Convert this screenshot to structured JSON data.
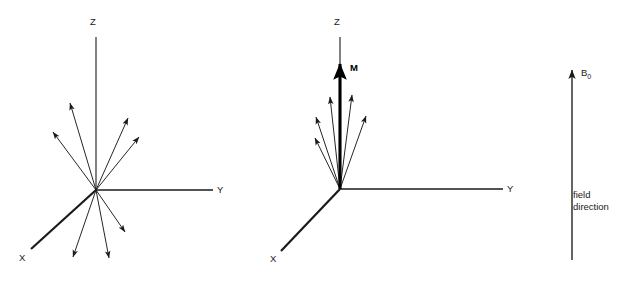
{
  "figure": {
    "background_color": "#ffffff",
    "line_color": "#1a1a1a",
    "bold_color": "#000000",
    "width": 638,
    "height": 283
  },
  "panels": [
    {
      "id": "random-spins",
      "origin": {
        "x": 96,
        "y": 190
      },
      "axes": [
        {
          "name": "z-axis",
          "label": "Z",
          "x1": 96,
          "y1": 37,
          "x2": 96,
          "y2": 190,
          "label_x": 90,
          "label_y": 25,
          "bold": false
        },
        {
          "name": "y-axis",
          "label": "Y",
          "x1": 96,
          "y1": 190,
          "x2": 213,
          "y2": 190,
          "label_x": 217,
          "label_y": 193,
          "bold": false
        },
        {
          "name": "x-axis",
          "label": "X",
          "x1": 96,
          "y1": 190,
          "x2": 31,
          "y2": 249,
          "label_x": 19,
          "label_y": 261,
          "bold": true
        }
      ],
      "spins": [
        {
          "name": "spin-1",
          "x2": 70,
          "y2": 103
        },
        {
          "name": "spin-2",
          "x2": 53,
          "y2": 132
        },
        {
          "name": "spin-3",
          "x2": 128,
          "y2": 118
        },
        {
          "name": "spin-4",
          "x2": 139,
          "y2": 137
        },
        {
          "name": "spin-5",
          "x2": 125,
          "y2": 232
        },
        {
          "name": "spin-6",
          "x2": 109,
          "y2": 258
        },
        {
          "name": "spin-7",
          "x2": 73,
          "y2": 257
        }
      ],
      "net_vector": null
    },
    {
      "id": "aligned-spins",
      "origin": {
        "x": 340,
        "y": 189
      },
      "axes": [
        {
          "name": "z-axis",
          "label": "Z",
          "x1": 340,
          "y1": 37,
          "x2": 340,
          "y2": 189,
          "label_x": 334,
          "label_y": 25,
          "bold": false
        },
        {
          "name": "y-axis",
          "label": "Y",
          "x1": 340,
          "y1": 189,
          "x2": 503,
          "y2": 189,
          "label_x": 507,
          "label_y": 192,
          "bold": false
        },
        {
          "name": "x-axis",
          "label": "X",
          "x1": 340,
          "y1": 189,
          "x2": 281,
          "y2": 251,
          "label_x": 270,
          "label_y": 262,
          "bold": true
        }
      ],
      "spins": [
        {
          "name": "spin-1",
          "x2": 330,
          "y2": 97
        },
        {
          "name": "spin-2",
          "x2": 316,
          "y2": 117
        },
        {
          "name": "spin-3",
          "x2": 315,
          "y2": 138
        },
        {
          "name": "spin-4",
          "x2": 352,
          "y2": 95
        },
        {
          "name": "spin-5",
          "x2": 366,
          "y2": 116
        }
      ],
      "net_vector": {
        "name": "magnetization-vector",
        "label": "M",
        "x1": 340,
        "y1": 189,
        "x2": 340,
        "y2": 64,
        "label_x": 350,
        "label_y": 71
      }
    }
  ],
  "field": {
    "name": "b0-field",
    "label_main": "B",
    "label_sub": "0",
    "arrow": {
      "x1": 572,
      "y1": 260,
      "x2": 572,
      "y2": 70
    },
    "label_x": 581,
    "label_y": 76,
    "caption_lines": [
      "field",
      "direction"
    ],
    "caption_x": 573,
    "caption_y": 198
  }
}
